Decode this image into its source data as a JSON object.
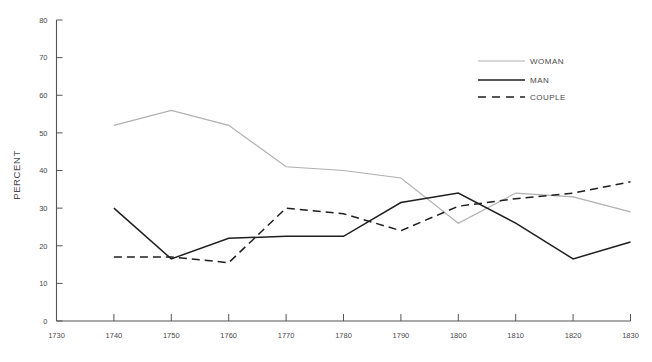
{
  "chart_data": {
    "type": "line",
    "title": "",
    "subtitle": "",
    "xlabel": "",
    "ylabel": "PERCENT",
    "x": [
      1740,
      1750,
      1760,
      1770,
      1780,
      1790,
      1800,
      1810,
      1820,
      1830
    ],
    "xlim": [
      1730,
      1830
    ],
    "ylim": [
      0,
      80
    ],
    "xticks": [
      1730,
      1740,
      1750,
      1760,
      1770,
      1780,
      1790,
      1800,
      1810,
      1820,
      1830
    ],
    "xtick_labels": [
      "1730",
      "1740",
      "1750",
      "1760",
      "1770",
      "1780",
      "1790",
      "1800",
      "1810",
      "1820",
      "1830"
    ],
    "yticks": [
      0,
      10,
      20,
      30,
      40,
      50,
      60,
      70,
      80
    ],
    "ytick_labels": [
      "0",
      "10",
      "20",
      "30",
      "40",
      "50",
      "60",
      "70",
      "80"
    ],
    "grid": false,
    "legend_position": "top-right",
    "series": [
      {
        "name": "WOMAN",
        "color": "#b0b0b0",
        "style": "solid",
        "width": 1.2,
        "values": [
          52,
          56,
          52,
          41,
          40,
          38,
          26,
          34,
          33,
          29
        ]
      },
      {
        "name": "MAN",
        "color": "#1f1f1f",
        "style": "solid",
        "width": 1.5,
        "values": [
          30,
          16.5,
          22,
          22.5,
          22.5,
          31.5,
          34,
          26,
          16.5,
          21
        ]
      },
      {
        "name": "COUPLE",
        "color": "#1f1f1f",
        "style": "dashed",
        "width": 1.5,
        "values": [
          17,
          17,
          15.5,
          30,
          28.5,
          24,
          30.5,
          32.5,
          34,
          37
        ]
      }
    ]
  },
  "legend": {
    "entries": [
      {
        "label": "WOMAN"
      },
      {
        "label": "MAN"
      },
      {
        "label": "COUPLE"
      }
    ]
  },
  "axes": {
    "y_title": "PERCENT"
  }
}
